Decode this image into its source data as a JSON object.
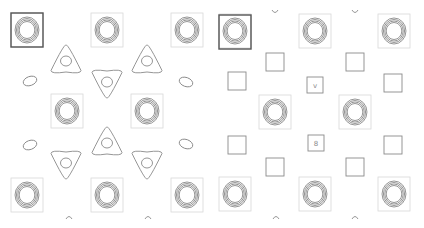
{
  "figure": {
    "description": "Two side-by-side contour lattice panels",
    "panels": [
      {
        "id": "left",
        "highlighted_cell": {
          "x": 11,
          "y": 13,
          "w": 32,
          "h": 34
        },
        "ring_cells": [
          {
            "cx": 27,
            "cy": 30
          },
          {
            "cx": 107,
            "cy": 30
          },
          {
            "cx": 187,
            "cy": 30
          },
          {
            "cx": 67,
            "cy": 111
          },
          {
            "cx": 147,
            "cy": 111
          },
          {
            "cx": 27,
            "cy": 195
          },
          {
            "cx": 107,
            "cy": 195
          },
          {
            "cx": 187,
            "cy": 195
          }
        ],
        "triangles_up": [
          {
            "cx": 66,
            "cy": 60
          },
          {
            "cx": 147,
            "cy": 60
          }
        ],
        "triangles_down": [
          {
            "cx": 107,
            "cy": 83
          },
          {
            "cx": 66,
            "cy": 164
          },
          {
            "cx": 147,
            "cy": 164
          }
        ],
        "triangle_up_mid": {
          "cx": 107,
          "cy": 142
        },
        "blobs": [
          {
            "cx": 30,
            "cy": 81
          },
          {
            "cx": 186,
            "cy": 82
          },
          {
            "cx": 30,
            "cy": 145
          },
          {
            "cx": 186,
            "cy": 144
          }
        ],
        "arcs": [
          {
            "cx": 69,
            "cy": 217
          },
          {
            "cx": 148,
            "cy": 217
          }
        ]
      },
      {
        "id": "right",
        "highlighted_cell": {
          "x": 219,
          "y": 15,
          "w": 32,
          "h": 34
        },
        "ring_cells": [
          {
            "cx": 235,
            "cy": 31
          },
          {
            "cx": 315,
            "cy": 31
          },
          {
            "cx": 394,
            "cy": 31
          },
          {
            "cx": 275,
            "cy": 112
          },
          {
            "cx": 355,
            "cy": 112
          },
          {
            "cx": 235,
            "cy": 194
          },
          {
            "cx": 315,
            "cy": 194
          },
          {
            "cx": 394,
            "cy": 194
          }
        ],
        "squares": [
          {
            "cx": 275,
            "cy": 62
          },
          {
            "cx": 355,
            "cy": 62
          },
          {
            "cx": 237,
            "cy": 81
          },
          {
            "cx": 393,
            "cy": 83
          },
          {
            "cx": 237,
            "cy": 145
          },
          {
            "cx": 393,
            "cy": 145
          },
          {
            "cx": 275,
            "cy": 167
          },
          {
            "cx": 355,
            "cy": 167
          }
        ],
        "small_squares": [
          {
            "cx": 315,
            "cy": 85,
            "glyph": "v"
          },
          {
            "cx": 316,
            "cy": 143,
            "glyph": "8"
          }
        ],
        "arcs_top": [
          {
            "cx": 275,
            "cy": 12
          },
          {
            "cx": 355,
            "cy": 12
          }
        ],
        "arcs_bottom": [
          {
            "cx": 276,
            "cy": 217
          },
          {
            "cx": 355,
            "cy": 217
          }
        ]
      }
    ],
    "colors": {
      "contour": "#8a8a8a",
      "cell_border": "#d8d8d8",
      "highlight_border": "#555555",
      "background": "#ffffff"
    }
  }
}
